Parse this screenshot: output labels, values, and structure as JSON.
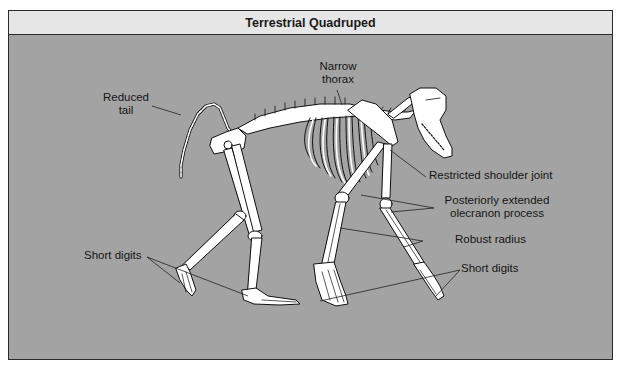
{
  "figure": {
    "title": "Terrestrial Quadruped",
    "background_color": "#a3a3a3",
    "header_color": "#e6e6e6"
  },
  "labels": {
    "reduced_tail": {
      "line1": "Reduced",
      "line2": "tail"
    },
    "narrow_thorax": {
      "line1": "Narrow",
      "line2": "thorax"
    },
    "restricted_shoulder_joint": "Restricted shoulder joint",
    "olecranon": {
      "line1": "Posteriorly extended",
      "line2": "olecranon process"
    },
    "robust_radius": "Robust radius",
    "short_digits_left": "Short digits",
    "short_digits_right": "Short digits"
  }
}
